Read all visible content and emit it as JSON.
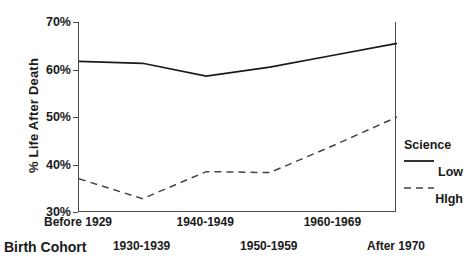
{
  "chart_data": {
    "type": "line",
    "title": "",
    "xlabel": "Birth Cohort",
    "ylabel": "% Life After Death",
    "categories": [
      "Before 1929",
      "1930-1939",
      "1940-1949",
      "1950-1959",
      "1960-1969",
      "After 1970"
    ],
    "ylim": [
      30,
      70
    ],
    "yticks": [
      "30%",
      "40%",
      "50%",
      "60%",
      "70%"
    ],
    "ytick_values": [
      30,
      40,
      50,
      60,
      70
    ],
    "grid": false,
    "legend_position": "right",
    "legend_title": "Science",
    "series": [
      {
        "name": "Low",
        "style": "solid",
        "color": "#1a1a1a",
        "values": [
          61.7,
          61.3,
          58.6,
          60.5,
          63.0,
          65.5
        ]
      },
      {
        "name": "HIgh",
        "style": "dashed",
        "color": "#444444",
        "values": [
          37.0,
          32.8,
          38.5,
          38.3,
          44.0,
          50.0
        ]
      }
    ]
  },
  "axis": {
    "y_title": "% Life After Death",
    "x_title": "Birth Cohort"
  },
  "legend": {
    "title": "Science",
    "entries": [
      {
        "label": "Low",
        "icon": "solid-line-icon"
      },
      {
        "label": "HIgh",
        "icon": "dashed-line-icon"
      }
    ]
  }
}
